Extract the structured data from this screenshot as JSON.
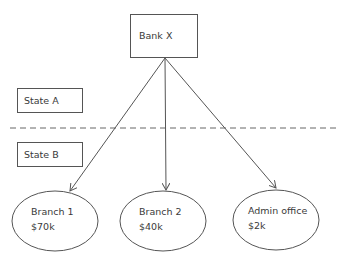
{
  "diagram": {
    "type": "hierarchy",
    "root": {
      "id": "bank_x",
      "label": "Bank X"
    },
    "regions": [
      {
        "id": "state_a",
        "label": "State A"
      },
      {
        "id": "state_b",
        "label": "State B"
      }
    ],
    "divider": {
      "style": "dashed",
      "separates": [
        "State A",
        "State B"
      ]
    },
    "children": [
      {
        "id": "branch_1",
        "name": "Branch 1",
        "value": "$70k"
      },
      {
        "id": "branch_2",
        "name": "Branch 2",
        "value": "$40k"
      },
      {
        "id": "admin_office",
        "name": "Admin office",
        "value": "$2k"
      }
    ],
    "edges": [
      {
        "from": "Bank X",
        "to": "Branch 1"
      },
      {
        "from": "Bank X",
        "to": "Branch 2"
      },
      {
        "from": "Bank X",
        "to": "Admin office"
      }
    ],
    "colors": {
      "stroke": "#555555",
      "text": "#3a3a3a",
      "background": "#ffffff"
    }
  }
}
